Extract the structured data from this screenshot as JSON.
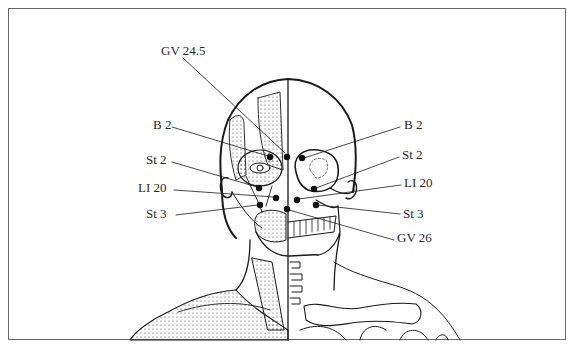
{
  "figure": {
    "labels_left": [
      {
        "id": "gv24_5",
        "text": "GV 24.5",
        "x": 161,
        "y": 44
      },
      {
        "id": "b2_l",
        "text": "B 2",
        "x": 153,
        "y": 118
      },
      {
        "id": "st2_l",
        "text": "St 2",
        "x": 146,
        "y": 153
      },
      {
        "id": "li20_l",
        "text": "LI 20",
        "x": 138,
        "y": 181
      },
      {
        "id": "st3_l",
        "text": "St 3",
        "x": 146,
        "y": 207
      }
    ],
    "labels_right": [
      {
        "id": "b2_r",
        "text": "B 2",
        "x": 404,
        "y": 118
      },
      {
        "id": "st2_r",
        "text": "St 2",
        "x": 402,
        "y": 148
      },
      {
        "id": "li20_r",
        "text": "LI 20",
        "x": 404,
        "y": 176
      },
      {
        "id": "st3_r",
        "text": "St 3",
        "x": 403,
        "y": 207
      },
      {
        "id": "gv26",
        "text": "GV 26",
        "x": 397,
        "y": 231
      }
    ],
    "points": [
      {
        "name": "GV 24.5",
        "x": 287,
        "y": 157
      },
      {
        "name": "B 2 left",
        "x": 270,
        "y": 157
      },
      {
        "name": "B 2 right",
        "x": 302,
        "y": 158
      },
      {
        "name": "St 2 left",
        "x": 259,
        "y": 188
      },
      {
        "name": "St 2 right",
        "x": 314,
        "y": 189
      },
      {
        "name": "LI 20 left",
        "x": 276,
        "y": 198
      },
      {
        "name": "LI 20 right",
        "x": 297,
        "y": 200
      },
      {
        "name": "St 3 left",
        "x": 260,
        "y": 205
      },
      {
        "name": "St 3 right",
        "x": 316,
        "y": 205
      },
      {
        "name": "GV 26",
        "x": 287,
        "y": 209
      }
    ],
    "colors": {
      "ink": "#1a1a1a",
      "border": "#6a6a6a",
      "label": "#2a2a2a"
    }
  }
}
